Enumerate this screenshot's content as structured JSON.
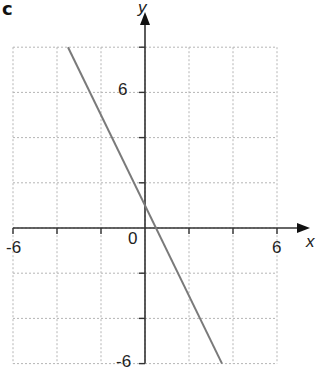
{
  "part_label": "c",
  "chart_data": {
    "type": "line",
    "title": "",
    "xlabel": "x",
    "ylabel": "y",
    "xlim": [
      -6,
      6
    ],
    "ylim": [
      -6,
      8
    ],
    "grid": true,
    "grid_step": 2,
    "x_tick_labels": [
      "-6",
      "0",
      "6"
    ],
    "y_tick_labels": [
      "6",
      "-6"
    ],
    "origin_label": "0",
    "series": [
      {
        "name": "line",
        "equation": "y = -2x + 1",
        "x": [
          -3.5,
          3.5
        ],
        "y": [
          8,
          -6
        ],
        "color": "#7a7a7a"
      }
    ],
    "colors": {
      "axis": "#333333",
      "grid": "#b5b5b5",
      "line": "#7a7a7a"
    }
  }
}
